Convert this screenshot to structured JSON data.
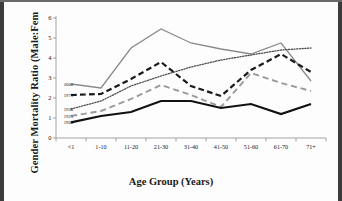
{
  "chart_data": {
    "type": "line",
    "title": "",
    "xlabel": "Age Group (Years)",
    "ylabel": "Gender Mortality Ratio (Male:Female)",
    "categories": [
      "<1",
      "1-10",
      "11-20",
      "21-30",
      "31-40",
      "41-50",
      "51-60",
      "61-70",
      "71+"
    ],
    "ylim": [
      0,
      6
    ],
    "yticks": [
      0,
      1,
      2,
      3,
      4,
      5,
      6
    ],
    "ytick_labels": [
      "0",
      "1",
      "2",
      "3",
      "4",
      "5",
      "6"
    ],
    "grid": false,
    "legend_position": "inside-left",
    "series": [
      {
        "name": "2000",
        "style": "solid",
        "color": "#8a8a8a",
        "width": 1.3,
        "values": [
          2.7,
          2.5,
          4.5,
          5.45,
          4.75,
          4.45,
          4.2,
          4.75,
          2.85
        ]
      },
      {
        "name": "1975",
        "style": "dashed",
        "color": "#1a1a1a",
        "width": 2.2,
        "values": [
          2.15,
          2.2,
          2.95,
          3.8,
          2.6,
          2.1,
          3.4,
          4.2,
          3.3
        ]
      },
      {
        "name": "1950",
        "style": "dotted",
        "color": "#4d4d4d",
        "width": 1.3,
        "values": [
          1.45,
          1.85,
          2.6,
          3.1,
          3.55,
          3.9,
          4.15,
          4.4,
          4.5
        ]
      },
      {
        "name": "1925",
        "style": "dashed",
        "color": "#9a9a9a",
        "width": 1.9,
        "values": [
          1.1,
          1.35,
          1.95,
          2.65,
          2.15,
          1.55,
          3.25,
          2.75,
          2.35
        ]
      },
      {
        "name": "1900",
        "style": "solid",
        "color": "#111111",
        "width": 2.2,
        "values": [
          0.78,
          1.1,
          1.3,
          1.85,
          1.85,
          1.5,
          1.7,
          1.2,
          1.7
        ]
      }
    ],
    "legend_entries": [
      {
        "label": "2000",
        "y_value": 2.7
      },
      {
        "label": "1975",
        "y_value": 2.15
      },
      {
        "label": "1950",
        "y_value": 1.45
      },
      {
        "label": "1925",
        "y_value": 1.1
      },
      {
        "label": "1900",
        "y_value": 0.78
      }
    ]
  },
  "axis": {
    "x_title": "Age Group (Years)",
    "y_title": "Gender Mortality Ratio (Male:Fem"
  }
}
